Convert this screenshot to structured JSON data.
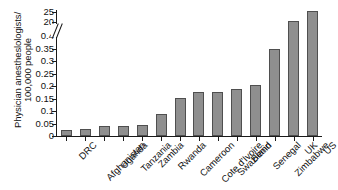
{
  "chart_data": {
    "type": "bar",
    "title": "",
    "xlabel": "",
    "ylabel_line1": "Physician anestheslologists/",
    "ylabel_line2": "100,000 people",
    "categories": [
      "DRC",
      "Afghanistan",
      "Uganda",
      "Tanzania",
      "Zambia",
      "Rwanda",
      "Cameroon",
      "Cote d'Ivoire",
      "Swaziland",
      "Benin",
      "Senegal",
      "Zimbabwe",
      "UK",
      "US"
    ],
    "values": [
      0.025,
      0.027,
      0.04,
      0.042,
      0.045,
      0.09,
      0.152,
      0.178,
      0.178,
      0.19,
      0.205,
      0.35,
      20.7,
      25.5
    ],
    "ytick_labels": [
      "0",
      "0.05",
      "0.1",
      "0.15",
      "0.2",
      "0.25",
      "0.3",
      "0.35",
      "0.4",
      "20",
      "25"
    ],
    "ytick_values": [
      0,
      0.05,
      0.1,
      0.15,
      0.2,
      0.25,
      0.3,
      0.35,
      0.4,
      20,
      25
    ],
    "axis_break": true,
    "axis_break_between": [
      0.4,
      20
    ],
    "ylim_lower": [
      0,
      0.4
    ],
    "ylim_upper": [
      20,
      26
    ],
    "grid": false,
    "legend": "none",
    "bar_color": "#8f8f8f",
    "bar_edge_color": "#4f4f4f",
    "axis_color": "#1a1a1a",
    "background": "#ffffff"
  }
}
